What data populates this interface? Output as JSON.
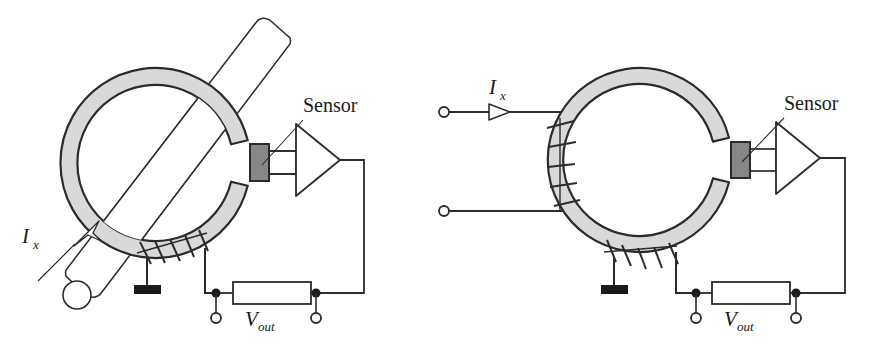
{
  "figure": {
    "background_color": "#ffffff",
    "width": 876,
    "height": 349,
    "panel_count": 2
  },
  "style": {
    "core_fill": "#d9d9d9",
    "core_stroke": "#2b2b2b",
    "sensor_fill": "#878787",
    "sensor_stroke": "#2b2b2b",
    "wire_color": "#2b2b2b",
    "conductor_fill": "#ffffff",
    "ground_fill": "#1a1a1a",
    "node_fill": "#1a1a1a",
    "terminal_fill": "#ffffff",
    "text_color": "#1a1a1a"
  },
  "panels": [
    {
      "id": "left",
      "name": "clamp-style-core-with-pass-through-conductor",
      "labels": {
        "sensor": "Sensor",
        "current": "I",
        "current_sub": "x",
        "voltage": "V",
        "voltage_sub": "out"
      },
      "core": {
        "center_x": 155,
        "center_y": 163,
        "outer_radius": 95,
        "inner_radius": 78,
        "gap_angle_deg": 14,
        "gap_center_deg": 0
      },
      "sensor": {
        "x": 250,
        "y": 144,
        "width": 19,
        "height": 37,
        "label": "Sensor"
      },
      "amplifier": {
        "tip_x": 340,
        "top_y": 124,
        "bottom_y": 196,
        "left_x": 296
      },
      "conductor": {
        "description": "primary conductor rod passing diagonally through core window",
        "angle_deg": 45,
        "end_cap": "rounded"
      },
      "current_arrow": {
        "style": "hollow-outline",
        "direction": "up-right"
      },
      "winding": {
        "location": "bottom-left of core",
        "turns": 5
      },
      "ground": {
        "x": 147,
        "y": 288
      },
      "vout_box": {
        "x": 233,
        "y": 282,
        "width": 78,
        "height": 22
      },
      "terminals": [
        {
          "cx": 216,
          "cy": 318,
          "r": 5
        },
        {
          "cx": 316,
          "cy": 318,
          "r": 5
        }
      ],
      "nodes": [
        {
          "cx": 216,
          "cy": 293,
          "r": 4
        },
        {
          "cx": 316,
          "cy": 293,
          "r": 4
        }
      ]
    },
    {
      "id": "right",
      "name": "toroid-core-with-primary-winding",
      "labels": {
        "sensor": "Sensor",
        "current": "I",
        "current_sub": "x",
        "voltage": "V",
        "voltage_sub": "out"
      },
      "core": {
        "center_x": 640,
        "center_y": 160,
        "outer_radius": 92,
        "inner_radius": 76,
        "gap_angle_deg": 14,
        "gap_center_deg": 0
      },
      "sensor": {
        "x": 731,
        "y": 142,
        "width": 19,
        "height": 36,
        "label": "Sensor"
      },
      "amplifier": {
        "tip_x": 820,
        "top_y": 122,
        "bottom_y": 194,
        "left_x": 776
      },
      "current_arrow": {
        "style": "hollow-outline",
        "direction": "right"
      },
      "input_terminals": [
        {
          "cx": 444,
          "cy": 112,
          "r": 5
        },
        {
          "cx": 444,
          "cy": 211,
          "r": 5
        }
      ],
      "primary_winding": {
        "location": "left side of core",
        "turns": 5
      },
      "secondary_winding": {
        "location": "bottom of core",
        "turns": 5
      },
      "ground": {
        "x": 614,
        "y": 288
      },
      "vout_box": {
        "x": 712,
        "y": 282,
        "width": 78,
        "height": 22
      },
      "terminals": [
        {
          "cx": 696,
          "cy": 318,
          "r": 5
        },
        {
          "cx": 796,
          "cy": 318,
          "r": 5
        }
      ],
      "nodes": [
        {
          "cx": 696,
          "cy": 293,
          "r": 4
        },
        {
          "cx": 796,
          "cy": 293,
          "r": 4
        }
      ]
    }
  ]
}
